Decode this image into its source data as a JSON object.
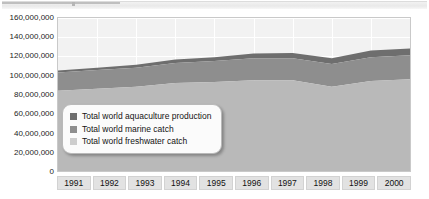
{
  "chart_data": {
    "type": "area",
    "stacked": true,
    "title": "",
    "subtitle": "",
    "xlabel": "",
    "ylabel": "",
    "categories": [
      "1991",
      "1992",
      "1993",
      "1994",
      "1995",
      "1996",
      "1997",
      "1998",
      "1999",
      "2000"
    ],
    "ylim": [
      0,
      160000000
    ],
    "ytick_labels": [
      "160,000,000",
      "140,000,000",
      "120,000,000",
      "100,000,000",
      "80,000,000",
      "60,000,000",
      "40,000,000",
      "20,000,000",
      "0"
    ],
    "ytick_values": [
      160000000,
      140000000,
      120000000,
      100000000,
      80000000,
      60000000,
      40000000,
      20000000,
      0
    ],
    "ytick_step": 20000000,
    "grid": true,
    "legend_position": "inside-lower-left",
    "series": [
      {
        "name": "Total world freshwater catch",
        "color": "#b9b9b9",
        "values": [
          84000000,
          86000000,
          88000000,
          92000000,
          93000000,
          95000000,
          95000000,
          88000000,
          94000000,
          96000000
        ]
      },
      {
        "name": "Total world marine catch",
        "color": "#8e8e8e",
        "values": [
          19000000,
          19500000,
          20000000,
          21000000,
          22000000,
          23000000,
          23000000,
          24000000,
          25000000,
          25000000
        ]
      },
      {
        "name": "Total world aquaculture production",
        "color": "#6e6e6e",
        "values": [
          2000000,
          2500000,
          3000000,
          3500000,
          4000000,
          5000000,
          5500000,
          6000000,
          7000000,
          7000000
        ]
      }
    ],
    "series_totals": [
      105000000,
      108000000,
      111000000,
      116500000,
      119000000,
      123000000,
      123500000,
      118000000,
      126000000,
      128000000
    ],
    "legend_entries": [
      "Total world aquaculture production",
      "Total world marine catch",
      "Total world freshwater catch"
    ],
    "legend_colors": [
      "#6e6e6e",
      "#8e8e8e",
      "#cdcdcd"
    ]
  }
}
